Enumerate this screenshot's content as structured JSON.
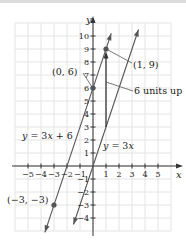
{
  "chart_data": {
    "type": "line",
    "title": "",
    "xlabel": "x",
    "ylabel": "y",
    "xlim": [
      -5.5,
      6
    ],
    "ylim": [
      -5,
      11
    ],
    "grid": true,
    "x_ticks": [
      "−5",
      "−4",
      "−3",
      "−2",
      "−1",
      "1",
      "2",
      "3",
      "4",
      "5"
    ],
    "y_ticks": [
      "10",
      "9",
      "8",
      "7",
      "6",
      "5",
      "4",
      "3",
      "2",
      "1",
      "−1",
      "−2",
      "−3",
      "−4"
    ],
    "series": [
      {
        "name": "y = 3x + 6",
        "slope": 3,
        "intercept": 6,
        "x": [
          -3.7,
          1.4
        ],
        "y": [
          -5.1,
          10.2
        ]
      },
      {
        "name": "y = 3x",
        "slope": 3,
        "intercept": 0,
        "x": [
          -1.5,
          3.5
        ],
        "y": [
          -4.5,
          10.5
        ]
      }
    ],
    "points": [
      {
        "label": "(0, 6)",
        "x": 0,
        "y": 6
      },
      {
        "label": "(1, 9)",
        "x": 1,
        "y": 9
      },
      {
        "label": "(−3, −3)",
        "x": -3,
        "y": -3
      }
    ],
    "annotations": [
      {
        "text": "6 units up",
        "arrow_from": [
          1,
          3
        ],
        "arrow_to": [
          1,
          9
        ]
      }
    ]
  },
  "labels": {
    "x_axis": "x",
    "y_axis": "y",
    "line1": "y = 3x + 6",
    "line2": "y = 3x",
    "point_a": "(0, 6)",
    "point_b": "(1, 9)",
    "point_c": "(−3, −3)",
    "annotation": "6 units up"
  }
}
